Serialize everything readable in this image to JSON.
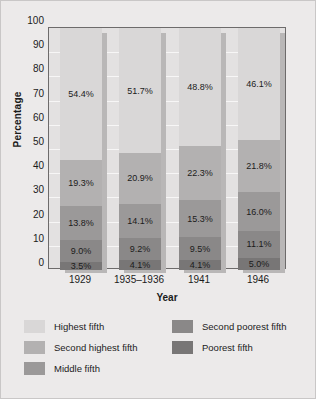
{
  "chart_data": {
    "type": "bar",
    "subtype": "stacked-100-percent",
    "title": "",
    "xlabel": "Year",
    "ylabel": "Percentage",
    "ylim": [
      0,
      100
    ],
    "ytick_step": 10,
    "yticks": [
      "100",
      "90",
      "80",
      "70",
      "60",
      "50",
      "40",
      "30",
      "20",
      "10",
      "0"
    ],
    "grid": true,
    "grid_axis": "y",
    "legend_position": "bottom",
    "categories": [
      "1929",
      "1935–1936",
      "1941",
      "1946"
    ],
    "series": [
      {
        "name": "Highest fifth",
        "color": "#d9d7d7",
        "values": [
          54.4,
          51.7,
          48.8,
          46.1
        ],
        "labels": [
          "54.4%",
          "51.7%",
          "48.8%",
          "46.1%"
        ]
      },
      {
        "name": "Second highest fifth",
        "color": "#b3b1b1",
        "values": [
          19.3,
          20.9,
          22.3,
          21.8
        ],
        "labels": [
          "19.3%",
          "20.9%",
          "22.3%",
          "21.8%"
        ]
      },
      {
        "name": "Middle fifth",
        "color": "#9b9999",
        "values": [
          13.8,
          14.1,
          15.3,
          16.0
        ],
        "labels": [
          "13.8%",
          "14.1%",
          "15.3%",
          "16.0%"
        ]
      },
      {
        "name": "Second poorest fifth",
        "color": "#8a8888",
        "values": [
          9.0,
          9.2,
          9.5,
          11.1
        ],
        "labels": [
          "9.0%",
          "9.2%",
          "9.5%",
          "11.1%"
        ]
      },
      {
        "name": "Poorest fifth",
        "color": "#787676",
        "values": [
          3.5,
          4.1,
          4.1,
          5.0
        ],
        "labels": [
          "3.5%",
          "4.1%",
          "4.1%",
          "5.0%"
        ]
      }
    ]
  },
  "legend": {
    "left_column": [
      {
        "label": "Highest fifth",
        "color": "#d9d7d7"
      },
      {
        "label": "Second highest fifth",
        "color": "#b3b1b1"
      },
      {
        "label": "Middle fifth",
        "color": "#9b9999"
      }
    ],
    "right_column": [
      {
        "label": "Second poorest fifth",
        "color": "#8a8888"
      },
      {
        "label": "Poorest fifth",
        "color": "#787676"
      }
    ]
  }
}
